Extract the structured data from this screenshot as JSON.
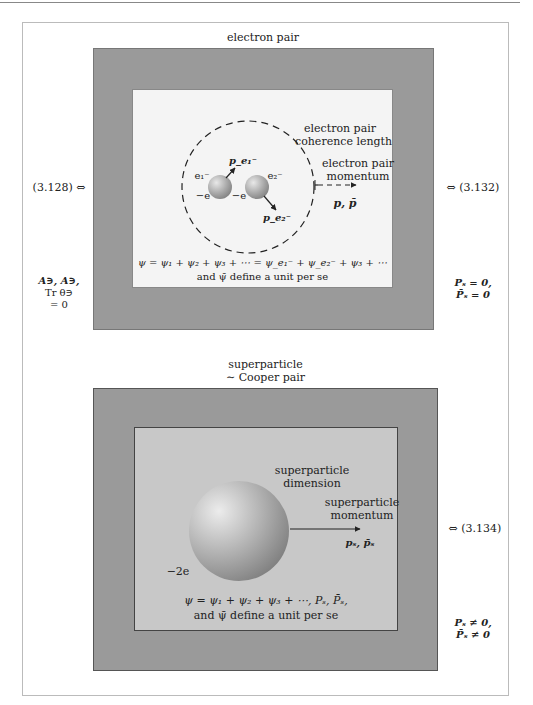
{
  "electron_pair_panel": {
    "title": "electron pair",
    "left_ref": "(3.128) ⇔",
    "left_condition": [
      "A∋, A∋,",
      "Tr θ∋",
      "= 0"
    ],
    "right_ref": "⇔ (3.132)",
    "right_condition": [
      "Pₛ = 0,",
      "P̄ₛ = 0"
    ],
    "coherence_label": [
      "electron pair",
      "coherence length"
    ],
    "momentum_label": [
      "electron pair",
      "momentum"
    ],
    "momentum_symbol": "p, p̄",
    "electron1": {
      "label": "e₁⁻",
      "charge": "−e",
      "momentum": "p_e₁⁻"
    },
    "electron2": {
      "label": "e₂⁻",
      "charge": "−e",
      "momentum": "p_e₂⁻"
    },
    "equation": "ψ = ψ₁ + ψ₂ + ψ₃ + ⋯ = ψ_e₁⁻ + ψ_e₂⁻ + ψ₃ + ⋯",
    "caption": "and ψ̄ define a unit per se"
  },
  "superparticle_panel": {
    "title": [
      "superparticle",
      "∼ Cooper pair"
    ],
    "right_ref": "⇔ (3.134)",
    "right_condition": [
      "Pₛ ≠ 0,",
      "P̄ₛ ≠ 0"
    ],
    "dimension_label": [
      "superparticle",
      "dimension"
    ],
    "momentum_label": [
      "superparticle",
      "momentum"
    ],
    "momentum_symbol": "pₛ, p̄ₛ",
    "charge": "−2e",
    "equation": "ψ = ψ₁ + ψ₂ + ψ₃ + ⋯, Pₛ, P̄ₛ,",
    "caption": "and ψ̄ define a unit per se"
  },
  "colors": {
    "outer_box": "#9a9a9a",
    "inner_white": "#f4f4f4",
    "inner_gray": "#c8c8c8",
    "sphere_light": "#e6e6e6",
    "sphere_dark": "#8a8a8a"
  }
}
